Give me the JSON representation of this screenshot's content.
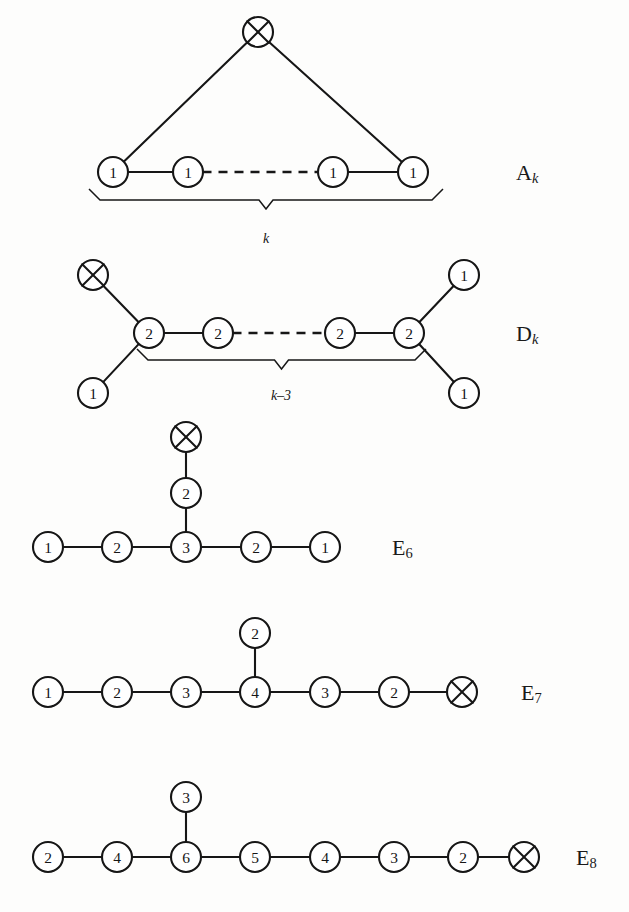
{
  "figure": {
    "kind": "affine-dynkin-diagrams",
    "background_color": "#fdfdfc",
    "ink_color": "#161616",
    "marked_node_glyph": "crossed-circle"
  },
  "diagrams": [
    {
      "id": "A",
      "label_base": "A",
      "label_sub": "k",
      "label_sub_italic": true,
      "label_x": 516,
      "label_y": 172,
      "brace": {
        "label": "k",
        "x1": 100,
        "x2": 432,
        "y": 200,
        "label_x": 266,
        "label_y": 238
      },
      "nodes": [
        {
          "id": "a-top",
          "x": 258,
          "y": 32,
          "r": 15,
          "value": "X",
          "marked": true
        },
        {
          "id": "a-1",
          "x": 113,
          "y": 172,
          "r": 15,
          "value": "1",
          "marked": false
        },
        {
          "id": "a-2",
          "x": 188,
          "y": 172,
          "r": 15,
          "value": "1",
          "marked": false
        },
        {
          "id": "a-3",
          "x": 333,
          "y": 172,
          "r": 15,
          "value": "1",
          "marked": false
        },
        {
          "id": "a-4",
          "x": 413,
          "y": 172,
          "r": 15,
          "value": "1",
          "marked": false
        }
      ],
      "edges": [
        {
          "from": "a-top",
          "to": "a-1",
          "style": "solid"
        },
        {
          "from": "a-top",
          "to": "a-4",
          "style": "solid"
        },
        {
          "from": "a-1",
          "to": "a-2",
          "style": "solid"
        },
        {
          "from": "a-2",
          "to": "a-3",
          "style": "dashed"
        },
        {
          "from": "a-3",
          "to": "a-4",
          "style": "solid"
        }
      ]
    },
    {
      "id": "D",
      "label_base": "D",
      "label_sub": "k",
      "label_sub_italic": true,
      "label_x": 516,
      "label_y": 333,
      "brace": {
        "label": "k–3",
        "x1": 148,
        "x2": 415,
        "y": 360,
        "label_x": 281,
        "label_y": 395
      },
      "nodes": [
        {
          "id": "d-x",
          "x": 93,
          "y": 275,
          "r": 15,
          "value": "X",
          "marked": true
        },
        {
          "id": "d-c1",
          "x": 149,
          "y": 333,
          "r": 15,
          "value": "2",
          "marked": false
        },
        {
          "id": "d-c2",
          "x": 218,
          "y": 333,
          "r": 15,
          "value": "2",
          "marked": false
        },
        {
          "id": "d-c3",
          "x": 340,
          "y": 333,
          "r": 15,
          "value": "2",
          "marked": false
        },
        {
          "id": "d-c4",
          "x": 409,
          "y": 333,
          "r": 15,
          "value": "2",
          "marked": false
        },
        {
          "id": "d-bl",
          "x": 93,
          "y": 393,
          "r": 15,
          "value": "1",
          "marked": false
        },
        {
          "id": "d-tr",
          "x": 464,
          "y": 275,
          "r": 15,
          "value": "1",
          "marked": false
        },
        {
          "id": "d-br",
          "x": 464,
          "y": 393,
          "r": 15,
          "value": "1",
          "marked": false
        }
      ],
      "edges": [
        {
          "from": "d-x",
          "to": "d-c1",
          "style": "solid"
        },
        {
          "from": "d-bl",
          "to": "d-c1",
          "style": "solid"
        },
        {
          "from": "d-c1",
          "to": "d-c2",
          "style": "solid"
        },
        {
          "from": "d-c2",
          "to": "d-c3",
          "style": "dashed"
        },
        {
          "from": "d-c3",
          "to": "d-c4",
          "style": "solid"
        },
        {
          "from": "d-c4",
          "to": "d-tr",
          "style": "solid"
        },
        {
          "from": "d-c4",
          "to": "d-br",
          "style": "solid"
        }
      ]
    },
    {
      "id": "E6",
      "label_base": "E",
      "label_sub": "6",
      "label_sub_italic": false,
      "label_x": 392,
      "label_y": 547,
      "brace": null,
      "nodes": [
        {
          "id": "e6-x",
          "x": 186,
          "y": 437,
          "r": 15,
          "value": "X",
          "marked": true
        },
        {
          "id": "e6-v",
          "x": 186,
          "y": 493,
          "r": 15,
          "value": "2",
          "marked": false
        },
        {
          "id": "e6-1",
          "x": 48,
          "y": 547,
          "r": 15,
          "value": "1",
          "marked": false
        },
        {
          "id": "e6-2",
          "x": 117,
          "y": 547,
          "r": 15,
          "value": "2",
          "marked": false
        },
        {
          "id": "e6-3",
          "x": 186,
          "y": 547,
          "r": 15,
          "value": "3",
          "marked": false
        },
        {
          "id": "e6-4",
          "x": 256,
          "y": 547,
          "r": 15,
          "value": "2",
          "marked": false
        },
        {
          "id": "e6-5",
          "x": 325,
          "y": 547,
          "r": 15,
          "value": "1",
          "marked": false
        }
      ],
      "edges": [
        {
          "from": "e6-x",
          "to": "e6-v",
          "style": "solid"
        },
        {
          "from": "e6-v",
          "to": "e6-3",
          "style": "solid"
        },
        {
          "from": "e6-1",
          "to": "e6-2",
          "style": "solid"
        },
        {
          "from": "e6-2",
          "to": "e6-3",
          "style": "solid"
        },
        {
          "from": "e6-3",
          "to": "e6-4",
          "style": "solid"
        },
        {
          "from": "e6-4",
          "to": "e6-5",
          "style": "solid"
        }
      ]
    },
    {
      "id": "E7",
      "label_base": "E",
      "label_sub": "7",
      "label_sub_italic": false,
      "label_x": 521,
      "label_y": 692,
      "brace": null,
      "nodes": [
        {
          "id": "e7-v",
          "x": 255,
          "y": 633,
          "r": 15,
          "value": "2",
          "marked": false
        },
        {
          "id": "e7-1",
          "x": 48,
          "y": 692,
          "r": 15,
          "value": "1",
          "marked": false
        },
        {
          "id": "e7-2",
          "x": 117,
          "y": 692,
          "r": 15,
          "value": "2",
          "marked": false
        },
        {
          "id": "e7-3",
          "x": 186,
          "y": 692,
          "r": 15,
          "value": "3",
          "marked": false
        },
        {
          "id": "e7-4",
          "x": 255,
          "y": 692,
          "r": 15,
          "value": "4",
          "marked": false
        },
        {
          "id": "e7-5",
          "x": 325,
          "y": 692,
          "r": 15,
          "value": "3",
          "marked": false
        },
        {
          "id": "e7-6",
          "x": 394,
          "y": 692,
          "r": 15,
          "value": "2",
          "marked": false
        },
        {
          "id": "e7-x",
          "x": 462,
          "y": 692,
          "r": 15,
          "value": "X",
          "marked": true
        }
      ],
      "edges": [
        {
          "from": "e7-v",
          "to": "e7-4",
          "style": "solid"
        },
        {
          "from": "e7-1",
          "to": "e7-2",
          "style": "solid"
        },
        {
          "from": "e7-2",
          "to": "e7-3",
          "style": "solid"
        },
        {
          "from": "e7-3",
          "to": "e7-4",
          "style": "solid"
        },
        {
          "from": "e7-4",
          "to": "e7-5",
          "style": "solid"
        },
        {
          "from": "e7-5",
          "to": "e7-6",
          "style": "solid"
        },
        {
          "from": "e7-6",
          "to": "e7-x",
          "style": "solid"
        }
      ]
    },
    {
      "id": "E8",
      "label_base": "E",
      "label_sub": "8",
      "label_sub_italic": false,
      "label_x": 576,
      "label_y": 857,
      "brace": null,
      "nodes": [
        {
          "id": "e8-v",
          "x": 186,
          "y": 797,
          "r": 15,
          "value": "3",
          "marked": false
        },
        {
          "id": "e8-1",
          "x": 48,
          "y": 857,
          "r": 15,
          "value": "2",
          "marked": false
        },
        {
          "id": "e8-2",
          "x": 117,
          "y": 857,
          "r": 15,
          "value": "4",
          "marked": false
        },
        {
          "id": "e8-3",
          "x": 186,
          "y": 857,
          "r": 15,
          "value": "6",
          "marked": false
        },
        {
          "id": "e8-4",
          "x": 255,
          "y": 857,
          "r": 15,
          "value": "5",
          "marked": false
        },
        {
          "id": "e8-5",
          "x": 325,
          "y": 857,
          "r": 15,
          "value": "4",
          "marked": false
        },
        {
          "id": "e8-6",
          "x": 394,
          "y": 857,
          "r": 15,
          "value": "3",
          "marked": false
        },
        {
          "id": "e8-7",
          "x": 463,
          "y": 857,
          "r": 15,
          "value": "2",
          "marked": false
        },
        {
          "id": "e8-x",
          "x": 524,
          "y": 857,
          "r": 15,
          "value": "X",
          "marked": true
        }
      ],
      "edges": [
        {
          "from": "e8-v",
          "to": "e8-3",
          "style": "solid"
        },
        {
          "from": "e8-1",
          "to": "e8-2",
          "style": "solid"
        },
        {
          "from": "e8-2",
          "to": "e8-3",
          "style": "solid"
        },
        {
          "from": "e8-3",
          "to": "e8-4",
          "style": "solid"
        },
        {
          "from": "e8-4",
          "to": "e8-5",
          "style": "solid"
        },
        {
          "from": "e8-5",
          "to": "e8-6",
          "style": "solid"
        },
        {
          "from": "e8-6",
          "to": "e8-7",
          "style": "solid"
        },
        {
          "from": "e8-7",
          "to": "e8-x",
          "style": "solid"
        }
      ]
    }
  ]
}
